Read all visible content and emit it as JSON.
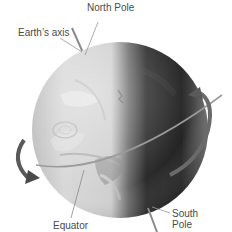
{
  "diagram": {
    "labels": {
      "north_pole": "North Pole",
      "earths_axis": "Earth’s axis",
      "equator": "Equator",
      "south_pole_line1": "South",
      "south_pole_line2": "Pole"
    },
    "colors": {
      "background": "#ffffff",
      "lit_side": "#d9d9d9",
      "dark_side": "#2a2a2a",
      "axis_line": "#8a8a8a",
      "arrow": "#5a5a5a",
      "label_text": "#4a4a4a"
    },
    "icons": {
      "rotation_arrow_right": "curved-arrow-icon",
      "rotation_arrow_left": "curved-arrow-icon"
    }
  }
}
